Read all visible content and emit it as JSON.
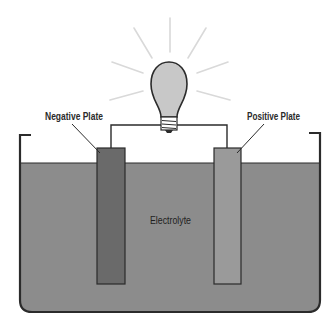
{
  "diagram": {
    "title": "",
    "labels": {
      "negative_plate": "Negative Plate",
      "positive_plate": "Positive Plate",
      "electrolyte": "Electrolyte"
    },
    "components": [
      {
        "id": "light-bulb",
        "type": "light bulb (lit)"
      },
      {
        "id": "wire",
        "type": "conductor connecting plates to bulb"
      },
      {
        "id": "negative-plate",
        "type": "electrode"
      },
      {
        "id": "positive-plate",
        "type": "electrode"
      },
      {
        "id": "electrolyte",
        "type": "liquid"
      },
      {
        "id": "container",
        "type": "tank"
      }
    ],
    "connections": [
      {
        "from": "negative-plate",
        "to": "light-bulb"
      },
      {
        "from": "light-bulb",
        "to": "positive-plate"
      }
    ],
    "colors": {
      "electrolyte": "#8c8c8c",
      "negative_plate": "#6a6a6a",
      "positive_plate": "#9a9a9a",
      "bulb_glass": "#c8c8c8",
      "outline": "#2b2b2b",
      "rays": "#d6d6d6"
    }
  }
}
